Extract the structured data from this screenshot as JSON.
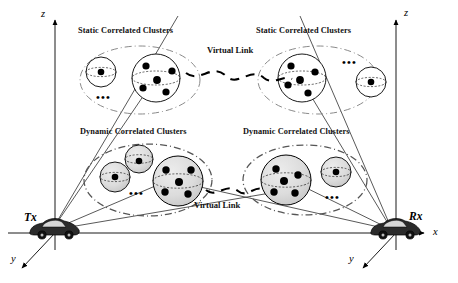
{
  "figure": {
    "background": "#ffffff",
    "ink": "#000000",
    "shade_fill": "#d8d8d8",
    "dash_ellipse_color": "#555555"
  },
  "axes": [
    {
      "id": "tx",
      "z_label": "z",
      "y_label": "y",
      "x_label": ""
    },
    {
      "id": "rx",
      "z_label": "z",
      "y_label": "y",
      "x_label": "x"
    }
  ],
  "nodes": [
    {
      "id": "tx",
      "label": "Tx",
      "icon": "car-icon"
    },
    {
      "id": "rx",
      "label": "Rx",
      "icon": "car-icon"
    }
  ],
  "cluster_groups": [
    {
      "id": "static-left",
      "heading": "Static Correlated Clusters",
      "kind": "static",
      "shaded": false,
      "ellipsis": "•••",
      "spheres": [
        {
          "role": "small",
          "dots": 1
        },
        {
          "role": "large",
          "dots": 5
        }
      ]
    },
    {
      "id": "static-right",
      "heading": "Static Correlated Clusters",
      "kind": "static",
      "shaded": false,
      "ellipsis": "•••",
      "spheres": [
        {
          "role": "large",
          "dots": 5
        },
        {
          "role": "small",
          "dots": 1
        }
      ]
    },
    {
      "id": "dynamic-left",
      "heading": "Dynamic Correlated Clusters",
      "kind": "dynamic",
      "shaded": true,
      "ellipsis": "•••",
      "spheres": [
        {
          "role": "small",
          "dots": 1
        },
        {
          "role": "small",
          "dots": 1
        },
        {
          "role": "large",
          "dots": 5
        }
      ]
    },
    {
      "id": "dynamic-right",
      "heading": "Dynamic Correlated Clusters",
      "kind": "dynamic",
      "shaded": true,
      "ellipsis": "•••",
      "spheres": [
        {
          "role": "large",
          "dots": 5
        },
        {
          "role": "small",
          "dots": 1
        }
      ]
    }
  ],
  "virtual_links": [
    {
      "id": "vlink-static",
      "label": "Virtual Link",
      "style": "dashed-wave"
    },
    {
      "id": "vlink-dynamic",
      "label": "Virtual Link",
      "style": "dashed-wave"
    }
  ]
}
